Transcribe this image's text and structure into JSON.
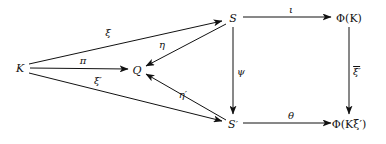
{
  "diagram": {
    "ink_color": "#111111",
    "background": "#ffffff",
    "nodes": [
      {
        "id": "K",
        "label": "K",
        "x": 20,
        "y": 68
      },
      {
        "id": "Q",
        "label": "Q",
        "x": 137,
        "y": 70
      },
      {
        "id": "S",
        "label": "S",
        "x": 233,
        "y": 18
      },
      {
        "id": "Sprime",
        "label": "S",
        "prime": "′",
        "x": 233,
        "y": 124
      },
      {
        "id": "PhiK",
        "label": "Φ(K)",
        "x": 349,
        "y": 18
      },
      {
        "id": "PhiKxi",
        "label": "Φ(Kξ′)",
        "x": 349,
        "y": 124
      }
    ],
    "edges": [
      {
        "id": "xi",
        "label": "ξ",
        "from": "K",
        "to": "S",
        "label_x": 108,
        "label_y": 33
      },
      {
        "id": "pi",
        "label": "π",
        "from": "K",
        "to": "Q",
        "label_x": 83,
        "label_y": 61
      },
      {
        "id": "xi-prime",
        "label": "ξ′",
        "from": "K",
        "to": "Sprime",
        "label_x": 98,
        "label_y": 81
      },
      {
        "id": "eta",
        "label": "η",
        "from": "S",
        "to": "Q",
        "label_x": 162,
        "label_y": 45
      },
      {
        "id": "eta-prime",
        "label": "η′",
        "from": "Sprime",
        "to": "Q",
        "label_x": 183,
        "label_y": 95
      },
      {
        "id": "iota",
        "label": "ι",
        "from": "S",
        "to": "PhiK",
        "label_x": 291,
        "label_y": 10
      },
      {
        "id": "psi",
        "label": "ψ",
        "from": "S",
        "to": "Sprime",
        "label_x": 241,
        "label_y": 72
      },
      {
        "id": "theta",
        "label": "θ",
        "from": "Sprime",
        "to": "PhiKxi",
        "label_x": 291,
        "label_y": 116
      },
      {
        "id": "xi-bar-prime",
        "label": "ξ′",
        "overline": true,
        "from": "PhiK",
        "to": "PhiKxi",
        "label_x": 357,
        "label_y": 72
      }
    ]
  }
}
